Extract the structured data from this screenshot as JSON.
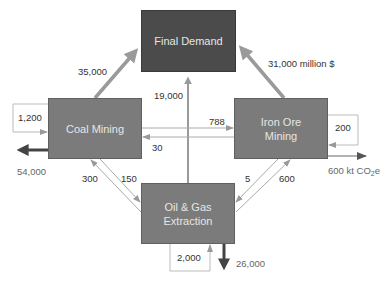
{
  "nodes": {
    "final_demand": "Final Demand",
    "coal_mining": "Coal Mining",
    "iron_ore_mining_line1": "Iron Ore",
    "iron_ore_mining_line2": "Mining",
    "oil_gas_line1": "Oil & Gas",
    "oil_gas_line2": "Extraction"
  },
  "flows": {
    "coal_to_final": "35,000",
    "iron_to_final": "31,000 million $",
    "oil_to_final": "19,000",
    "coal_to_iron": "788",
    "iron_to_coal": "30",
    "oil_to_coal": "300",
    "coal_to_oil": "150",
    "iron_to_oil": "5",
    "oil_to_iron": "600",
    "coal_self": "1,200",
    "iron_self": "200",
    "oil_self": "2,000"
  },
  "emissions": {
    "coal": "54,000",
    "iron_prefix": "600 kt CO",
    "iron_sub": "2",
    "iron_suffix": "e",
    "oil": "26,000"
  },
  "colors": {
    "final_demand_fill": "#4b4b4b",
    "sector_fill": "#7b7b7b",
    "major_arrow": "#999999",
    "minor_arrow": "#aaaaaa",
    "emission_arrow": "#444444"
  }
}
